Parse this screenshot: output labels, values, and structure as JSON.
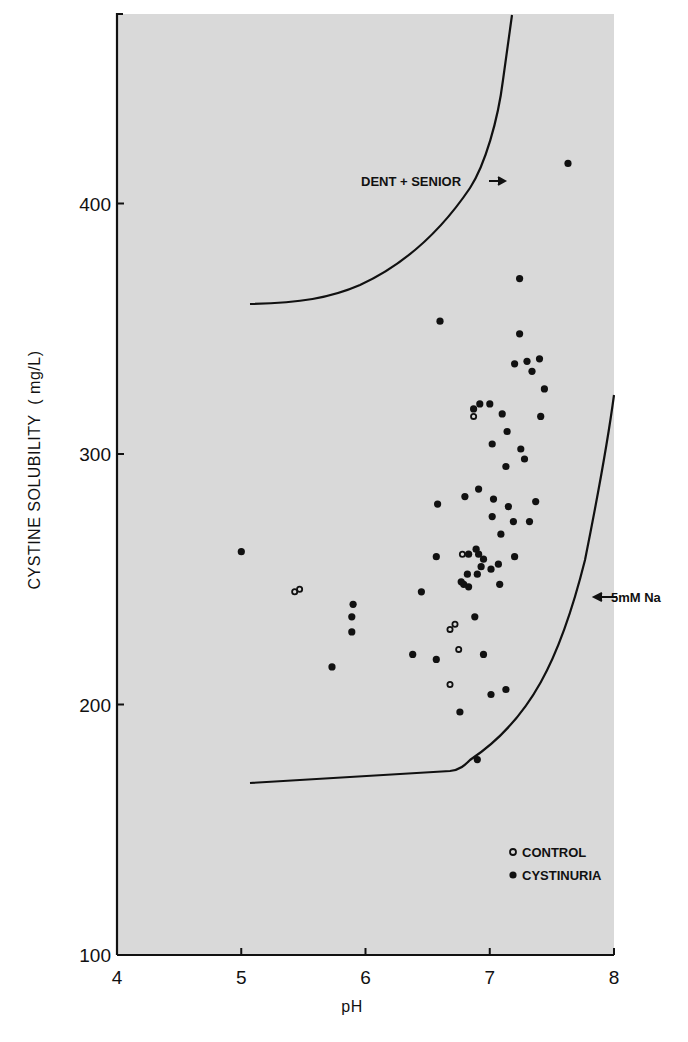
{
  "chart_data": {
    "type": "scatter",
    "title": "",
    "xlabel": "pH",
    "ylabel": "CYSTINE SOLUBILITY ( mg/L)",
    "xlim": [
      4,
      8
    ],
    "ylim": [
      100,
      475
    ],
    "x_ticks": [
      4,
      5,
      6,
      7,
      8
    ],
    "y_ticks": [
      100,
      200,
      300,
      400
    ],
    "grid": false,
    "legend_position": "lower right inside",
    "legend": [
      {
        "label": "CONTROL",
        "marker": "open-circle"
      },
      {
        "label": "CYSTINURIA",
        "marker": "filled-circle"
      }
    ],
    "annotations": [
      {
        "text": "DENT + SENIOR",
        "arrow": "right",
        "x": 6.35,
        "y": 409
      },
      {
        "text": "5mM Na",
        "arrow": "left",
        "x": 7.62,
        "y": 231
      }
    ],
    "curves": [
      {
        "name": "DENT + SENIOR",
        "points": [
          [
            5.0,
            304
          ],
          [
            5.2,
            306
          ],
          [
            5.5,
            314
          ],
          [
            5.8,
            328
          ],
          [
            6.1,
            346
          ],
          [
            6.4,
            365
          ],
          [
            6.6,
            382
          ],
          [
            6.8,
            370
          ],
          [
            6.9,
            385
          ],
          [
            7.0,
            396
          ],
          [
            7.1,
            420
          ],
          [
            7.15,
            440
          ],
          [
            7.2,
            470
          ],
          [
            7.23,
            474
          ]
        ]
      },
      {
        "name": "5mM Na",
        "points": [
          [
            5.0,
            170
          ],
          [
            5.5,
            172
          ],
          [
            6.0,
            173
          ],
          [
            6.5,
            175
          ],
          [
            6.65,
            177
          ],
          [
            6.8,
            183
          ],
          [
            7.0,
            194
          ],
          [
            7.2,
            210
          ],
          [
            7.4,
            230
          ],
          [
            7.55,
            255
          ],
          [
            7.7,
            283
          ],
          [
            7.85,
            305
          ],
          [
            8.0,
            324
          ]
        ]
      }
    ],
    "series": [
      {
        "name": "CONTROL",
        "marker": "open",
        "points": [
          [
            5.43,
            245
          ],
          [
            5.47,
            246
          ],
          [
            6.87,
            315
          ],
          [
            6.78,
            260
          ],
          [
            6.72,
            232
          ],
          [
            6.68,
            230
          ],
          [
            6.75,
            222
          ],
          [
            6.68,
            208
          ]
        ]
      },
      {
        "name": "CYSTINURIA",
        "marker": "filled",
        "points": [
          [
            5.0,
            261
          ],
          [
            5.73,
            215
          ],
          [
            5.9,
            240
          ],
          [
            5.89,
            235
          ],
          [
            5.89,
            229
          ],
          [
            6.38,
            220
          ],
          [
            6.45,
            245
          ],
          [
            6.57,
            218
          ],
          [
            6.6,
            353
          ],
          [
            6.58,
            280
          ],
          [
            6.57,
            259
          ],
          [
            6.76,
            197
          ],
          [
            6.9,
            178
          ],
          [
            6.8,
            283
          ],
          [
            6.83,
            260
          ],
          [
            6.82,
            252
          ],
          [
            6.79,
            248
          ],
          [
            6.83,
            247
          ],
          [
            6.77,
            249
          ],
          [
            6.87,
            318
          ],
          [
            6.92,
            320
          ],
          [
            6.91,
            286
          ],
          [
            6.89,
            262
          ],
          [
            6.91,
            260
          ],
          [
            6.9,
            252
          ],
          [
            6.93,
            255
          ],
          [
            6.95,
            258
          ],
          [
            6.88,
            235
          ],
          [
            6.95,
            220
          ],
          [
            7.0,
            320
          ],
          [
            7.02,
            304
          ],
          [
            7.03,
            282
          ],
          [
            7.02,
            275
          ],
          [
            7.07,
            256
          ],
          [
            7.08,
            248
          ],
          [
            7.09,
            268
          ],
          [
            7.1,
            316
          ],
          [
            7.13,
            295
          ],
          [
            7.14,
            309
          ],
          [
            7.15,
            279
          ],
          [
            7.19,
            273
          ],
          [
            7.01,
            254
          ],
          [
            7.01,
            204
          ],
          [
            7.13,
            206
          ],
          [
            7.2,
            336
          ],
          [
            7.24,
            370
          ],
          [
            7.24,
            348
          ],
          [
            7.25,
            302
          ],
          [
            7.28,
            298
          ],
          [
            7.3,
            337
          ],
          [
            7.34,
            333
          ],
          [
            7.32,
            273
          ],
          [
            7.37,
            281
          ],
          [
            7.4,
            338
          ],
          [
            7.41,
            315
          ],
          [
            7.44,
            326
          ],
          [
            7.2,
            259
          ],
          [
            7.63,
            416
          ]
        ]
      }
    ]
  },
  "axes": {
    "x_title": "pH",
    "y_title": "CYSTINE SOLUBILITY  ( mg/L)",
    "x_tick_labels": [
      "4",
      "5",
      "6",
      "7",
      "8"
    ],
    "y_tick_labels": [
      "100",
      "200",
      "300",
      "400"
    ]
  },
  "annotations": {
    "upper_curve_label": "DENT + SENIOR",
    "lower_curve_label": "5mM Na"
  },
  "legend": {
    "control_label": "CONTROL",
    "cystinuria_label": "CYSTINURIA"
  },
  "colors": {
    "plot_background": "#d9d9d9",
    "ink": "#111111",
    "page": "#ffffff"
  }
}
